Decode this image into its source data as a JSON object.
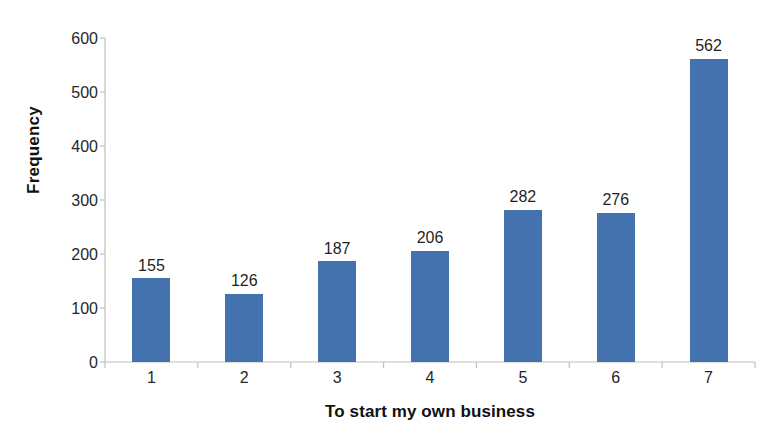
{
  "chart_data": {
    "type": "bar",
    "title": "",
    "categories": [
      "1",
      "2",
      "3",
      "4",
      "5",
      "6",
      "7"
    ],
    "values": [
      155,
      126,
      187,
      206,
      282,
      276,
      562
    ],
    "data_labels": [
      "155",
      "126",
      "187",
      "206",
      "282",
      "276",
      "562"
    ],
    "xlabel": "To start my own business",
    "ylabel": "Frequency",
    "ylim": [
      0,
      600
    ],
    "ytick_labels": [
      "0",
      "100",
      "200",
      "300",
      "400",
      "500",
      "600"
    ],
    "ytick_values": [
      0,
      100,
      200,
      300,
      400,
      500,
      600
    ],
    "grid": false,
    "legend": false,
    "series": [
      {
        "name": "Frequency",
        "color": "#4472ae",
        "values": [
          155,
          126,
          187,
          206,
          282,
          276,
          562
        ]
      }
    ],
    "colors": {
      "bar": "#4472ae",
      "axis_line": "#bfbfbf",
      "tick_text": "#262626",
      "title_text": "#111111",
      "background": "#ffffff"
    }
  }
}
